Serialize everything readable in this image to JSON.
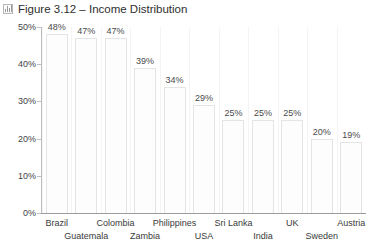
{
  "title": {
    "text": "Figure 3.12 – Income Distribution",
    "icon": "bar-chart-icon"
  },
  "chart_data": {
    "type": "bar",
    "title": "Figure 3.12 – Income Distribution",
    "xlabel": "",
    "ylabel": "",
    "ylim": [
      0,
      50
    ],
    "grid": false,
    "legend": null,
    "value_suffix": "%",
    "categories": [
      "Brazil",
      "Guatemala",
      "Colombia",
      "Zambia",
      "Philippines",
      "USA",
      "Sri Lanka",
      "India",
      "UK",
      "Sweden",
      "Austria"
    ],
    "values": [
      48,
      47,
      47,
      39,
      34,
      29,
      25,
      25,
      25,
      20,
      19
    ],
    "data_labels": [
      "48%",
      "47%",
      "47%",
      "39%",
      "34%",
      "29%",
      "25%",
      "25%",
      "25%",
      "20%",
      "19%"
    ],
    "yticks": [
      0,
      10,
      20,
      30,
      40,
      50
    ],
    "ytick_labels": [
      "0%",
      "10%",
      "20%",
      "30%",
      "40%",
      "50%"
    ],
    "bar_fill": "#fdfdfd",
    "bar_border": "#e4e4e4",
    "axis_color": "#9c9c9c",
    "text_color": "#3a3a3a"
  }
}
